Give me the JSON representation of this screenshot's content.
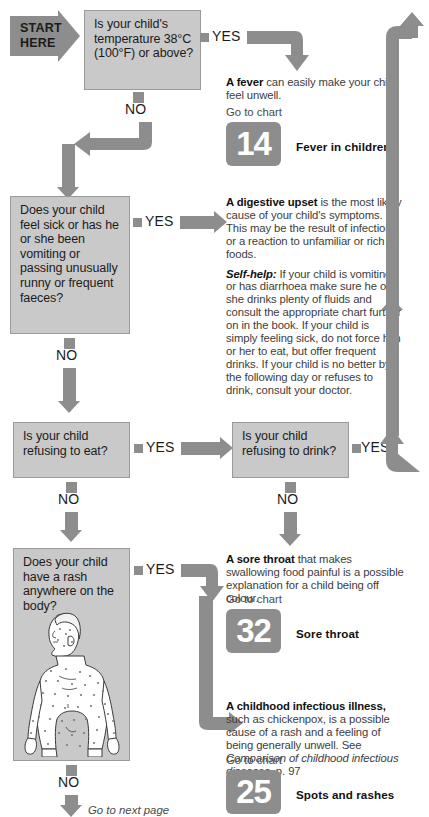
{
  "start": {
    "line1": "START",
    "line2": "HERE"
  },
  "labels": {
    "yes": "YES",
    "no": "NO",
    "go_to_chart": "Go to chart",
    "next_page": "Go to next page"
  },
  "questions": [
    {
      "id": "temperature",
      "text": "Is your child's temperature 38°C (100°F) or above?"
    },
    {
      "id": "sick-vomiting",
      "text": "Does your child feel sick or has he or she been vomiting or passing unusually runny or frequent faeces?"
    },
    {
      "id": "refusing-eat",
      "text": "Is your child refusing to eat?"
    },
    {
      "id": "refusing-drink",
      "text": "Is your child refusing to drink?"
    },
    {
      "id": "rash",
      "text": "Does your child have a rash anywhere on the body?"
    }
  ],
  "outcomes": [
    {
      "id": "fever",
      "lead": "A fever",
      "body": " can easily make your child feel unwell.",
      "chart_number": "14",
      "chart_title": "Fever in children"
    },
    {
      "id": "digestive-upset",
      "lead": "A digestive upset",
      "body": " is the most likely cause of your child's symptoms. This may be the result of infection or a reaction to unfamiliar or rich foods.",
      "selfhelp_lead": "Self-help:",
      "selfhelp_body": " If your child is vomiting or has diarrhoea make sure he or she drinks plenty of fluids and consult the appropriate chart further on in the book. If your child is simply feeling sick, do not force him or her to eat, but offer frequent drinks. If your child is no better by the following day or refuses to drink, consult your doctor."
    },
    {
      "id": "sore-throat",
      "lead": "A sore throat",
      "body": " that makes swallowing food painful is a possible explanation for a child being off colour.",
      "chart_number": "32",
      "chart_title": "Sore throat"
    },
    {
      "id": "childhood-infectious-illness",
      "lead": "A childhood infectious illness,",
      "body": " such as chickenpox, is a possible cause of a rash and a feeling of being generally unwell. See ",
      "reference_italic": "Comparison of childhood infectious diseases",
      "body_tail": ", p. 97",
      "chart_number": "25",
      "chart_title": "Spots and rashes"
    }
  ],
  "colors": {
    "box_fill": "#c9c9c9",
    "box_border": "#9a9a9a",
    "arrow": "#8d8d8d",
    "text": "#1b1b1b",
    "advice_text": "#3d3d3d",
    "background": "#ffffff"
  },
  "illustration": {
    "name": "child-with-rash",
    "alt": "Front view of a child's body covered in spots"
  }
}
